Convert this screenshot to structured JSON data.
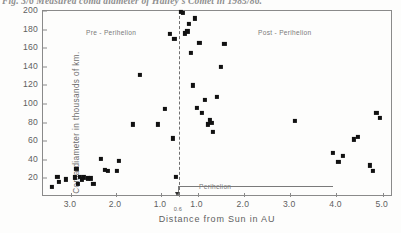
{
  "caption": "Fig. 3/6  Measured coma diameter of Halley's Comet in 1985/86.",
  "chart_data": {
    "type": "scatter",
    "title": "Fig. 3/6  Measured coma diameter of Halley's Comet in 1985/86.",
    "xlabel": "Distance from Sun in AU",
    "ylabel": "Coma diameter in thousands of km.",
    "ylim": [
      0,
      200
    ],
    "yticks": [
      20,
      40,
      60,
      80,
      100,
      120,
      140,
      160,
      180,
      200
    ],
    "grid": false,
    "legend": null,
    "axis_note": "Folded axis: distance decreases to perihelion (0.6 AU) then increases again.",
    "xtick_labels_pre": [
      "3.0",
      "2.0",
      "1.0"
    ],
    "perihelion_tick_label": "0.6",
    "xtick_labels_post": [
      "1.0",
      "2.0",
      "3.0",
      "4.0",
      "5.0"
    ],
    "annotations": [
      {
        "text": "Pre - Perihelion",
        "branch": "pre"
      },
      {
        "text": "Post - Perihelion",
        "branch": "post"
      },
      {
        "text": "Perihelion",
        "branch": "marker"
      }
    ],
    "perihelion_au": 0.6,
    "series": [
      {
        "name": "Pre-Perihelion",
        "branch": "pre",
        "points": [
          {
            "au": 3.42,
            "d": 11
          },
          {
            "au": 3.3,
            "d": 22
          },
          {
            "au": 3.26,
            "d": 16
          },
          {
            "au": 3.12,
            "d": 19
          },
          {
            "au": 2.92,
            "d": 21
          },
          {
            "au": 2.88,
            "d": 30
          },
          {
            "au": 2.84,
            "d": 14
          },
          {
            "au": 2.8,
            "d": 22
          },
          {
            "au": 2.76,
            "d": 19
          },
          {
            "au": 2.72,
            "d": 21
          },
          {
            "au": 2.62,
            "d": 20
          },
          {
            "au": 2.56,
            "d": 20
          },
          {
            "au": 2.5,
            "d": 14
          },
          {
            "au": 2.34,
            "d": 41
          },
          {
            "au": 2.24,
            "d": 29
          },
          {
            "au": 2.18,
            "d": 28
          },
          {
            "au": 1.98,
            "d": 28
          },
          {
            "au": 1.94,
            "d": 39
          },
          {
            "au": 1.62,
            "d": 78
          },
          {
            "au": 1.46,
            "d": 131
          },
          {
            "au": 1.06,
            "d": 78
          },
          {
            "au": 0.92,
            "d": 95
          },
          {
            "au": 0.8,
            "d": 175
          },
          {
            "au": 0.74,
            "d": 63
          },
          {
            "au": 0.7,
            "d": 170
          },
          {
            "au": 0.66,
            "d": 22
          }
        ]
      },
      {
        "name": "Post-Perihelion",
        "branch": "post",
        "points": [
          {
            "au": 0.64,
            "d": 200
          },
          {
            "au": 0.68,
            "d": 198
          },
          {
            "au": 0.72,
            "d": 176
          },
          {
            "au": 0.78,
            "d": 178
          },
          {
            "au": 0.82,
            "d": 186
          },
          {
            "au": 0.86,
            "d": 155
          },
          {
            "au": 0.9,
            "d": 120
          },
          {
            "au": 0.94,
            "d": 192
          },
          {
            "au": 0.98,
            "d": 96
          },
          {
            "au": 1.04,
            "d": 166
          },
          {
            "au": 1.1,
            "d": 90
          },
          {
            "au": 1.16,
            "d": 104
          },
          {
            "au": 1.22,
            "d": 78
          },
          {
            "au": 1.26,
            "d": 83
          },
          {
            "au": 1.3,
            "d": 80
          },
          {
            "au": 1.34,
            "d": 70
          },
          {
            "au": 1.42,
            "d": 108
          },
          {
            "au": 1.5,
            "d": 140
          },
          {
            "au": 1.58,
            "d": 165
          },
          {
            "au": 3.1,
            "d": 82
          },
          {
            "au": 3.92,
            "d": 47
          },
          {
            "au": 4.04,
            "d": 38
          },
          {
            "au": 4.14,
            "d": 44
          },
          {
            "au": 4.38,
            "d": 62
          },
          {
            "au": 4.46,
            "d": 65
          },
          {
            "au": 4.72,
            "d": 34
          },
          {
            "au": 4.78,
            "d": 28
          },
          {
            "au": 4.86,
            "d": 90
          },
          {
            "au": 4.94,
            "d": 85
          }
        ]
      }
    ]
  }
}
